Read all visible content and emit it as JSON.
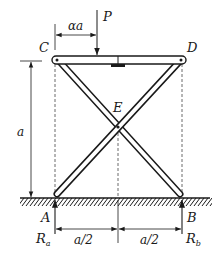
{
  "colors": {
    "ink": "#1a1a1a",
    "dash": "#444444",
    "background": "#ffffff"
  },
  "labels": {
    "load": "P",
    "offset_dimension": "αa",
    "point_c": "C",
    "point_d": "D",
    "point_e": "E",
    "point_a": "A",
    "point_b": "B",
    "height_dimension": "a",
    "reaction_a_main": "R",
    "reaction_a_sub": "a",
    "reaction_b_main": "R",
    "reaction_b_sub": "b",
    "half_span_left": "a/2",
    "half_span_right": "a/2"
  },
  "components": {
    "top_beam": "beam CD",
    "bar_1": "bar CEB",
    "bar_2": "bar DEA",
    "ground": "hatched ground line"
  }
}
